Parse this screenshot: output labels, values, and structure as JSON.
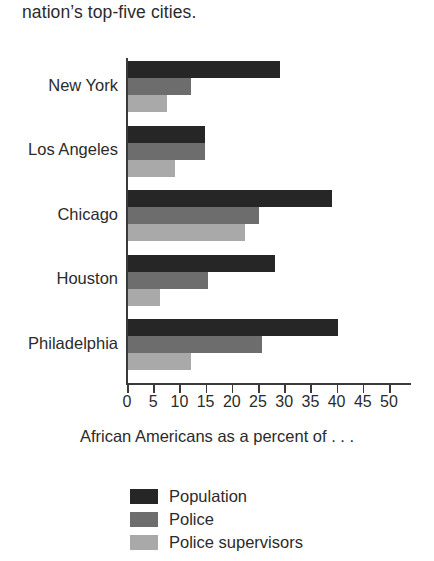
{
  "lead_text": "nation’s top-five cities.",
  "chart_data": {
    "type": "bar",
    "orientation": "horizontal",
    "title": "",
    "subtitle": "",
    "xlabel": "African Americans as a percent of . . .",
    "ylabel": "",
    "xlim": [
      0,
      50
    ],
    "xticks": [
      0,
      5,
      10,
      15,
      20,
      25,
      30,
      35,
      40,
      45,
      50
    ],
    "xtick_labels": [
      "0",
      "5",
      "10",
      "15",
      "20",
      "25",
      "30",
      "35",
      "40",
      "45",
      "50"
    ],
    "grid": false,
    "legend_position": "bottom-left",
    "categories": [
      "New York",
      "Los Angeles",
      "Chicago",
      "Houston",
      "Philadelphia"
    ],
    "series": [
      {
        "name": "Population",
        "color": "#262626",
        "values": [
          29,
          14.7,
          39,
          28,
          40
        ]
      },
      {
        "name": "Police",
        "color": "#6d6d6d",
        "values": [
          12,
          14.7,
          25,
          15.3,
          25.5
        ]
      },
      {
        "name": "Police supervisors",
        "color": "#a9a9a9",
        "values": [
          7.4,
          9,
          22.3,
          6.1,
          12
        ]
      }
    ]
  },
  "legend": {
    "items": [
      {
        "label": "Population",
        "swatch": "s0"
      },
      {
        "label": "Police",
        "swatch": "s1"
      },
      {
        "label": "Police supervisors",
        "swatch": "s2"
      }
    ]
  }
}
